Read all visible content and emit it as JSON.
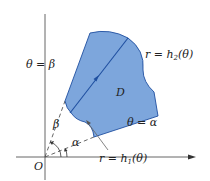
{
  "diagram": {
    "type": "polar region in plane",
    "colors": {
      "region_fill": "#7da6dc",
      "region_stroke": "#1f4fa0",
      "axis": "#555555",
      "ray": "#666666",
      "text": "#222222"
    },
    "labels": {
      "origin": "O",
      "region": "D",
      "theta_beta": "θ = β",
      "theta_alpha": "θ = α",
      "outer_curve_prefix": "r = h",
      "outer_curve_sub": "2",
      "outer_curve_suffix": "(θ)",
      "inner_curve_prefix": "r = h",
      "inner_curve_sub": "1",
      "inner_curve_suffix": "(θ)",
      "angle_beta": "β",
      "angle_alpha": "α"
    }
  }
}
